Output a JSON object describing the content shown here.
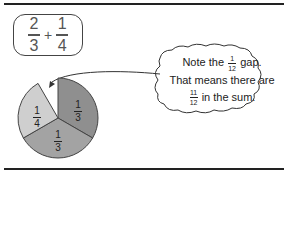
{
  "expression": {
    "a_num": "2",
    "a_den": "3",
    "op": "+",
    "b_num": "1",
    "b_den": "4"
  },
  "pie": {
    "slices": [
      {
        "label_num": "1",
        "label_den": "3",
        "color": "#8f8f8f"
      },
      {
        "label_num": "1",
        "label_den": "3",
        "color": "#a3a3a3"
      },
      {
        "label_num": "1",
        "label_den": "4",
        "color": "#cfcfcf"
      }
    ],
    "gap": "1/12"
  },
  "callout": {
    "line1_pre": "Note the",
    "line1_num": "1",
    "line1_den": "12",
    "line1_post": "gap.",
    "line2": "That means there are",
    "line3_num": "11",
    "line3_den": "12",
    "line3_post": "in the sum."
  }
}
